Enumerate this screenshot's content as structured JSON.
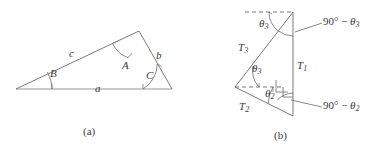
{
  "figure": {
    "title_hidden": "",
    "stroke_color": "#6b6b6b",
    "text_color": "#3b3b3b",
    "background": "#ffffff"
  },
  "panel_a": {
    "caption": "(a)",
    "side_a_label": "a",
    "side_b_label": "b",
    "side_c_label": "c",
    "angle_A_label": "A",
    "angle_B_label": "B",
    "angle_C_label": "C"
  },
  "panel_b": {
    "caption": "(b)",
    "t1_label": "T",
    "t1_sub": "1",
    "t2_label": "T",
    "t2_sub": "2",
    "t3_label": "T",
    "t3_sub": "3",
    "theta3_upper_label": "θ",
    "theta3_upper_sub": "3",
    "theta3_lower_label": "θ",
    "theta3_lower_sub": "3",
    "theta2_label": "θ",
    "theta2_sub": "2",
    "comp3_prefix": "90° − ",
    "comp3_theta": "θ",
    "comp3_sub": "3",
    "comp2_prefix": "90° − ",
    "comp2_theta": "θ",
    "comp2_sub": "2"
  }
}
